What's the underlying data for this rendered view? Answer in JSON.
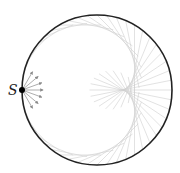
{
  "diagram": {
    "circle": {
      "cx": 97,
      "cy": 90,
      "r": 75,
      "stroke": "#222222",
      "stroke_width": 1.6
    },
    "source": {
      "label": "S",
      "x": 22,
      "y": 90,
      "dot_radius": 3,
      "color": "#000000"
    },
    "emitted_arrows": {
      "count": 7,
      "angle_spread_deg": 120,
      "length": 21,
      "color": "#8a8a8a"
    },
    "reflected_rays": {
      "count": 48,
      "color": "#cfcfcf",
      "stroke_width": 0.6
    },
    "caustic": {
      "type": "cardioid",
      "cusp_x": 122,
      "cusp_y": 90
    }
  }
}
